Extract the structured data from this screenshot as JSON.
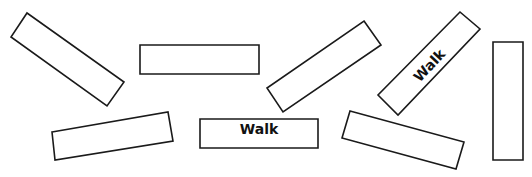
{
  "worksheet": {
    "background": "#ffffff",
    "stroke_color": "#1a1a1a",
    "cards": [
      {
        "id": "card-1",
        "label": "",
        "points": "27,13 124,82 107,106 11,37"
      },
      {
        "id": "card-2",
        "label": "",
        "points": "140,45 259,45 259,74 140,74"
      },
      {
        "id": "card-3",
        "label": "",
        "points": "364,21 381,45 283,112 267,88"
      },
      {
        "id": "card-4",
        "label": "Walk",
        "points": "460,12 480,29 398,115 378,95",
        "label_x": 430,
        "label_y": 66,
        "label_rotate": -47
      },
      {
        "id": "card-5",
        "label": "",
        "points": "493,42 523,42 523,160 493,160"
      },
      {
        "id": "card-6",
        "label": "",
        "points": "52,132 168,112 173,141 55,160"
      },
      {
        "id": "card-7",
        "label": "Walk",
        "points": "200,119 318,119 318,148 200,148",
        "label_x": 259,
        "label_y": 134,
        "label_rotate": 0
      },
      {
        "id": "card-8",
        "label": "",
        "points": "350,111 464,142 456,169 342,138"
      }
    ]
  }
}
